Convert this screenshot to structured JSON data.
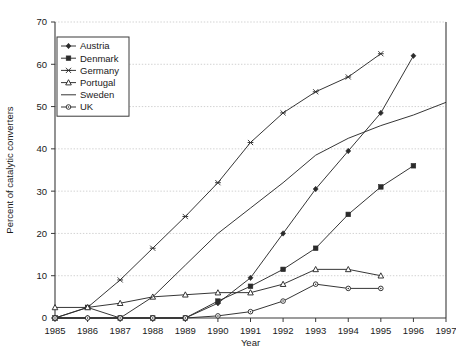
{
  "chart_data": {
    "type": "line",
    "title": "",
    "xlabel": "Year",
    "ylabel": "Percent of catalytic converters",
    "x": [
      1985,
      1986,
      1987,
      1988,
      1989,
      1990,
      1991,
      1992,
      1993,
      1994,
      1995,
      1996,
      1997
    ],
    "xlim": [
      1985,
      1997
    ],
    "ylim": [
      0,
      70
    ],
    "yticks": [
      0,
      10,
      20,
      30,
      40,
      50,
      60,
      70
    ],
    "xticks": [
      "1985",
      "1986",
      "1987",
      "1988",
      "1989",
      "1990",
      "1991",
      "1992",
      "1993",
      "1994",
      "1995",
      "1996",
      "1997"
    ],
    "grid": "horizontal-dotted",
    "legend_position": "upper-left-inside",
    "series": [
      {
        "name": "Austria",
        "marker": "diamond",
        "x": [
          1985,
          1986,
          1987,
          1988,
          1989,
          1990,
          1991,
          1992,
          1993,
          1994,
          1995,
          1996
        ],
        "values": [
          0,
          0,
          0,
          0,
          0,
          3.5,
          9.5,
          20,
          30.5,
          39.5,
          48.5,
          62
        ]
      },
      {
        "name": "Denmark",
        "marker": "filled-square",
        "x": [
          1985,
          1986,
          1987,
          1988,
          1989,
          1990,
          1991,
          1992,
          1993,
          1994,
          1995,
          1996
        ],
        "values": [
          0,
          2.5,
          0,
          0,
          0,
          4,
          7.5,
          11.5,
          16.5,
          24.5,
          31,
          36
        ]
      },
      {
        "name": "Germany",
        "marker": "cross-x",
        "x": [
          1985,
          1986,
          1987,
          1988,
          1989,
          1990,
          1991,
          1992,
          1993,
          1994,
          1995
        ],
        "values": [
          0,
          2.5,
          9,
          16.5,
          24,
          32,
          41.5,
          48.5,
          53.5,
          57,
          62.5
        ]
      },
      {
        "name": "Portugal",
        "marker": "triangle",
        "x": [
          1985,
          1986,
          1987,
          1988,
          1989,
          1990,
          1991,
          1992,
          1993,
          1994,
          1995
        ],
        "values": [
          2.5,
          2.5,
          3.5,
          5,
          5.5,
          6,
          6,
          8,
          11.5,
          11.5,
          10
        ]
      },
      {
        "name": "Sweden",
        "marker": "none",
        "x": [
          1985,
          1986,
          1987,
          1988,
          1989,
          1990,
          1991,
          1992,
          1993,
          1994,
          1995,
          1996,
          1997
        ],
        "values": [
          0,
          0,
          0,
          5,
          12.5,
          20,
          26,
          32,
          38.5,
          42.5,
          45.5,
          48,
          51
        ]
      },
      {
        "name": "UK",
        "marker": "open-circle",
        "x": [
          1985,
          1986,
          1987,
          1988,
          1989,
          1990,
          1991,
          1992,
          1993,
          1994,
          1995
        ],
        "values": [
          0,
          0,
          0,
          0,
          0,
          0.5,
          1.5,
          4,
          8,
          7,
          7
        ]
      }
    ]
  },
  "legend": {
    "items": [
      {
        "label": "Austria"
      },
      {
        "label": "Denmark"
      },
      {
        "label": "Germany"
      },
      {
        "label": "Portugal"
      },
      {
        "label": "Sweden"
      },
      {
        "label": "UK"
      }
    ]
  },
  "axes": {
    "y_title": "Percent of catalytic converters",
    "x_title": "Year"
  }
}
